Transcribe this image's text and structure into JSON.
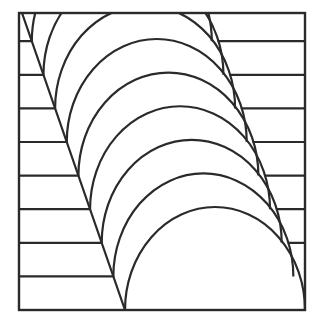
{
  "figure": {
    "stroke_color": "#2a2a2a",
    "background": "#ffffff",
    "frame": {
      "x1": 19,
      "y1": 13,
      "x2": 305,
      "y2": 310
    },
    "diagonal": {
      "x1": 22,
      "y1": 13,
      "x2": 125,
      "y2": 310
    },
    "arc_count": 10,
    "arc_base": {
      "cx": 215,
      "cy": 310,
      "rx": 90,
      "ry": 103
    },
    "arc_step": {
      "dx": -11.65,
      "dy": -33.6
    },
    "left_hatch_count": 8,
    "right_hatch_indices": [
      2,
      3,
      4,
      5,
      6,
      7,
      8
    ]
  }
}
